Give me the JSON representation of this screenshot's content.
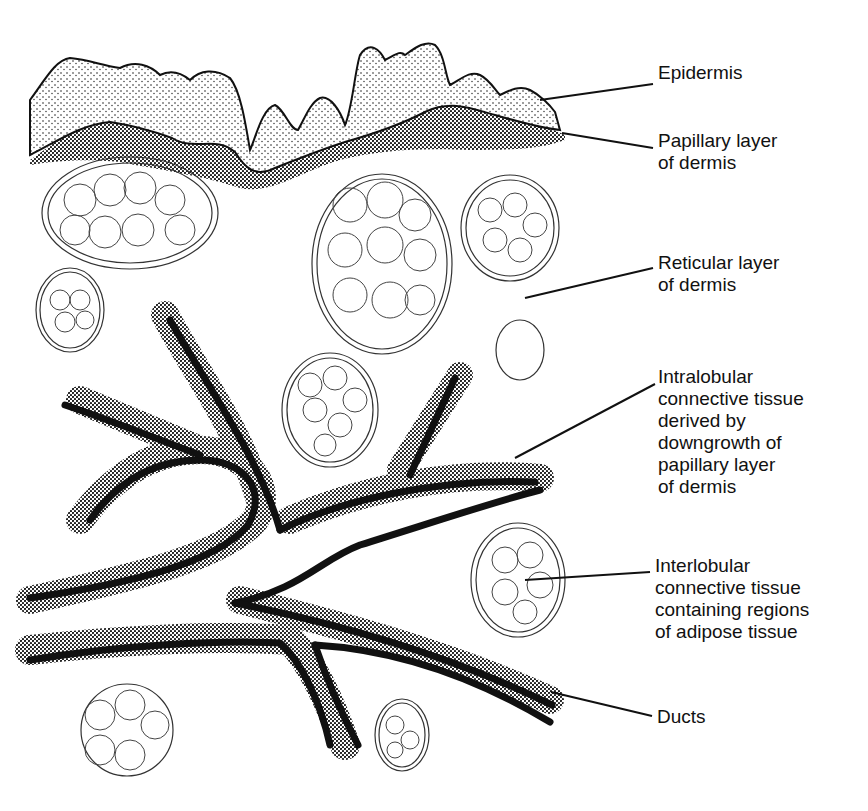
{
  "diagram": {
    "type": "histology illustration",
    "colors": {
      "ink": "#111111",
      "background": "#ffffff",
      "stipple": "#1a1a1a"
    },
    "labels": [
      {
        "id": "epidermis",
        "text": "Epidermis",
        "x": 658,
        "y": 62,
        "line": [
          540,
          100,
          653,
          84
        ]
      },
      {
        "id": "papillary",
        "text": "Papillary layer\nof dermis",
        "x": 658,
        "y": 128,
        "line": [
          562,
          133,
          653,
          148
        ]
      },
      {
        "id": "reticular",
        "text": "Reticular layer\nof dermis",
        "x": 658,
        "y": 250,
        "line": [
          525,
          298,
          653,
          268
        ]
      },
      {
        "id": "intralobular",
        "text": "Intralobular\nconnective tissue\nderived by\ndowngrowth of\npapillary layer\nof dermis",
        "x": 658,
        "y": 364,
        "line": [
          515,
          458,
          655,
          384
        ]
      },
      {
        "id": "interlobular",
        "text": "Interlobular\nconnective tissue\ncontaining regions\nof adipose tissue",
        "x": 655,
        "y": 554,
        "line": [
          525,
          580,
          650,
          572
        ]
      },
      {
        "id": "ducts",
        "text": "Ducts",
        "x": 657,
        "y": 706,
        "line": [
          551,
          692,
          652,
          716
        ]
      }
    ]
  }
}
